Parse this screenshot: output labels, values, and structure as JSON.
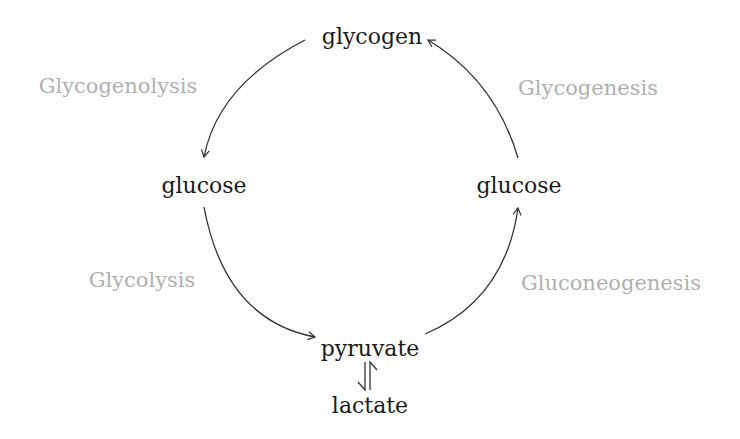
{
  "diagram": {
    "nodes": {
      "glycogen": "glycogen",
      "glucose_left": "glucose",
      "glucose_right": "glucose",
      "pyruvate": "pyruvate",
      "lactate": "lactate"
    },
    "processes": {
      "glycogenolysis": "Glycogenolysis",
      "glycogenesis": "Glycogenesis",
      "glycolysis": "Glycolysis",
      "gluconeogenesis": "Gluconeogenesis"
    },
    "edges": [
      {
        "from": "glycogen",
        "to": "glucose_left",
        "label": "Glycogenolysis"
      },
      {
        "from": "glucose_left",
        "to": "pyruvate",
        "label": "Glycolysis"
      },
      {
        "from": "pyruvate",
        "to": "glucose_right",
        "label": "Gluconeogenesis"
      },
      {
        "from": "glucose_right",
        "to": "glycogen",
        "label": "Glycogenesis"
      },
      {
        "from": "pyruvate",
        "to": "lactate",
        "label": "",
        "type": "equilibrium"
      }
    ],
    "colors": {
      "node_text": "#1a1a1a",
      "process_text": "#b0b0b0",
      "arrow": "#333333"
    }
  }
}
